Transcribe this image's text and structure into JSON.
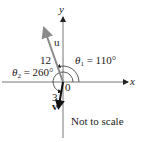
{
  "diagram": {
    "axes": {
      "x_label": "x",
      "y_label": "y",
      "origin_label": "0"
    },
    "vectors": [
      {
        "name": "u",
        "magnitude_label": "12",
        "angle_symbol": "θ",
        "angle_sub": "1",
        "angle_text": " = 110°",
        "color": "#8a8a8a"
      },
      {
        "name": "v",
        "magnitude_label": "3",
        "angle_symbol": "θ",
        "angle_sub": "2",
        "angle_text": " = 260°",
        "color": "#111111"
      }
    ],
    "note": "Not to scale"
  }
}
